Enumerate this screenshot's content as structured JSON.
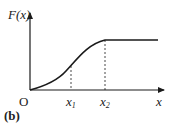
{
  "figure": {
    "panel_label": "(b)",
    "y_axis_label": "F(x)",
    "x_axis_label": "x",
    "origin_label": "O",
    "ticks": [
      {
        "base": "x",
        "sub": "1"
      },
      {
        "base": "x",
        "sub": "2"
      }
    ],
    "colors": {
      "stroke": "#1a1a1a",
      "text": "#222222",
      "background": "#ffffff"
    }
  }
}
